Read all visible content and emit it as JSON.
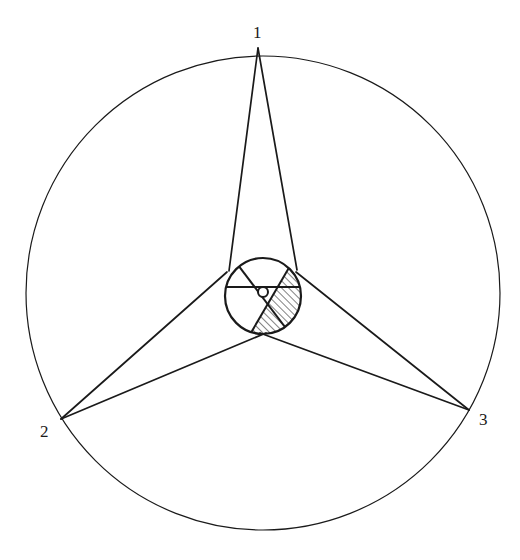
{
  "diagram": {
    "type": "geometric-figure",
    "stroke_color": "#1a1a1a",
    "background": "#ffffff",
    "outer_circle": {
      "cx": 263,
      "cy": 293,
      "r": 237
    },
    "inner_circle": {
      "cx": 263,
      "cy": 296,
      "r": 38
    },
    "center_circle": {
      "cx": 263,
      "cy": 292,
      "r": 5
    },
    "vertices": [
      {
        "id": "1",
        "label": "1",
        "x": 258,
        "y": 48,
        "label_x": 253,
        "label_y": 24
      },
      {
        "id": "2",
        "label": "2",
        "x": 61,
        "y": 419,
        "label_x": 40,
        "label_y": 423
      },
      {
        "id": "3",
        "label": "3",
        "x": 469,
        "y": 410,
        "label_x": 479,
        "label_y": 411
      }
    ],
    "tangent_lines": [
      {
        "from": "1",
        "x1": 258,
        "y1": 48,
        "x2": 229,
        "y2": 271
      },
      {
        "from": "1",
        "x1": 258,
        "y1": 48,
        "x2": 297,
        "y2": 270
      },
      {
        "from": "2",
        "x1": 61,
        "y1": 419,
        "x2": 227,
        "y2": 272
      },
      {
        "from": "2",
        "x1": 61,
        "y1": 419,
        "x2": 266,
        "y2": 333
      },
      {
        "from": "3",
        "x1": 469,
        "y1": 410,
        "x2": 296,
        "y2": 272
      },
      {
        "from": "3",
        "x1": 469,
        "y1": 410,
        "x2": 260,
        "y2": 333
      }
    ],
    "chords": [
      {
        "name": "horizontal",
        "x1": 226,
        "y1": 287,
        "x2": 300,
        "y2": 287
      },
      {
        "name": "top-left-to-bottom-right",
        "x1": 238,
        "y1": 265,
        "x2": 285,
        "y2": 327
      },
      {
        "name": "top-right-to-bottom-left",
        "x1": 290,
        "y1": 266,
        "x2": 252,
        "y2": 331
      }
    ],
    "hatched_region": "right side of inner circle bounded by the top-right-to-bottom-left chord",
    "labels": [
      "1",
      "2",
      "3"
    ]
  }
}
